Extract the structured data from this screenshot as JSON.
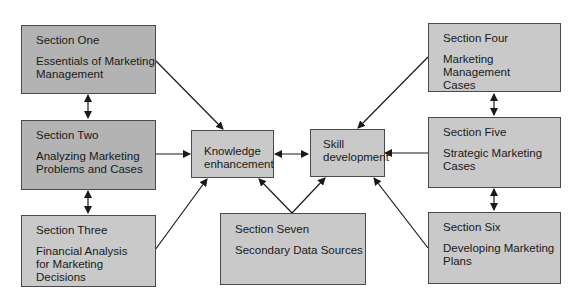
{
  "diagram": {
    "sections": [
      {
        "id": "one",
        "title": "Section One",
        "subtitle": "Essentials of Marketing\nManagement"
      },
      {
        "id": "two",
        "title": "Section Two",
        "subtitle": "Analyzing Marketing\nProblems and Cases"
      },
      {
        "id": "three",
        "title": "Section Three",
        "subtitle": "Financial Analysis\nfor Marketing\nDecisions"
      },
      {
        "id": "four",
        "title": "Section Four",
        "subtitle": "Marketing Management\nCases"
      },
      {
        "id": "five",
        "title": "Section Five",
        "subtitle": "Strategic Marketing\nCases"
      },
      {
        "id": "six",
        "title": "Section Six",
        "subtitle": "Developing Marketing\nPlans"
      },
      {
        "id": "seven",
        "title": "Section Seven",
        "subtitle": "Secondary Data Sources"
      }
    ],
    "hubs": [
      {
        "id": "knowledge",
        "label": "Knowledge\nenhancement"
      },
      {
        "id": "skill",
        "label": "Skill\ndevelopment"
      }
    ],
    "edges": [
      {
        "from": "one",
        "to": "knowledge",
        "type": "arrow"
      },
      {
        "from": "two",
        "to": "knowledge",
        "type": "arrow"
      },
      {
        "from": "three",
        "to": "knowledge",
        "type": "arrow"
      },
      {
        "from": "seven",
        "to": "knowledge",
        "type": "arrow"
      },
      {
        "from": "seven",
        "to": "skill",
        "type": "arrow"
      },
      {
        "from": "four",
        "to": "skill",
        "type": "arrow"
      },
      {
        "from": "five",
        "to": "skill",
        "type": "arrow"
      },
      {
        "from": "six",
        "to": "skill",
        "type": "arrow"
      },
      {
        "from": "knowledge",
        "to": "skill",
        "type": "bidirectional"
      },
      {
        "from": "one",
        "to": "two",
        "type": "bidirectional"
      },
      {
        "from": "two",
        "to": "three",
        "type": "bidirectional"
      },
      {
        "from": "four",
        "to": "five",
        "type": "bidirectional"
      },
      {
        "from": "five",
        "to": "six",
        "type": "bidirectional"
      }
    ],
    "colors": {
      "box_dark": "#b3b3b3",
      "box_light": "#c9c9c9",
      "line": "#1a1a1a"
    }
  }
}
